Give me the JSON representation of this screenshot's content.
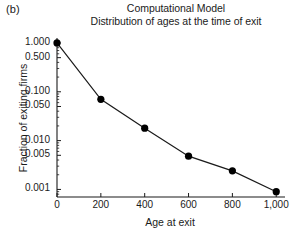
{
  "panel": {
    "label": "(b)"
  },
  "chart_data": {
    "type": "line",
    "title": "Computational Model",
    "subtitle": "Distribution of ages at the time of exit",
    "title_lines": [
      "Computational Model",
      "Distribution of ages at the time of exit"
    ],
    "xlabel": "Age at exit",
    "ylabel": "Fraction of exiting firms",
    "x": [
      0,
      200,
      400,
      600,
      800,
      1000
    ],
    "values": [
      1.0,
      0.07,
      0.018,
      0.0048,
      0.0024,
      0.0009
    ],
    "series": [
      {
        "name": "Fraction of exiting firms",
        "x": [
          0,
          200,
          400,
          600,
          800,
          1000
        ],
        "values": [
          1.0,
          0.07,
          0.018,
          0.0048,
          0.0024,
          0.0009
        ]
      }
    ],
    "yscale": "log",
    "xscale": "linear",
    "xlim": [
      0,
      1040
    ],
    "ylim": [
      0.0007,
      1.15
    ],
    "grid": false,
    "legend": false,
    "legend_position": "none",
    "marker": "filled-circle",
    "marker_color": "#000000",
    "line_color": "#1a1a1a",
    "xticks": [
      {
        "value": 0,
        "label": "0"
      },
      {
        "value": 200,
        "label": "200"
      },
      {
        "value": 400,
        "label": "400"
      },
      {
        "value": 600,
        "label": "600"
      },
      {
        "value": 800,
        "label": "800"
      },
      {
        "value": 1000,
        "label": "1,000"
      }
    ],
    "yticks": [
      {
        "value": 1.0,
        "label": "1.000"
      },
      {
        "value": 0.5,
        "label": "0.500"
      },
      {
        "value": 0.1,
        "label": "0.100"
      },
      {
        "value": 0.05,
        "label": "0.050"
      },
      {
        "value": 0.01,
        "label": "0.010"
      },
      {
        "value": 0.005,
        "label": "0.005"
      },
      {
        "value": 0.001,
        "label": "0.001"
      }
    ]
  }
}
